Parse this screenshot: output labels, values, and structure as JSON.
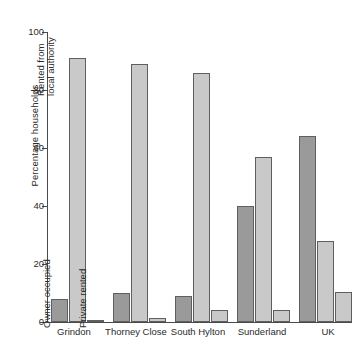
{
  "chart_data": {
    "type": "bar",
    "title": "",
    "xlabel": "",
    "ylabel": "Percentage households",
    "ylim": [
      0,
      100
    ],
    "yticks": [
      0,
      20,
      40,
      60,
      80,
      100
    ],
    "grid": false,
    "legend_position": "in-plot rotated annotations over first group",
    "categories": [
      "Grindon",
      "Thorney Close",
      "South Hylton",
      "Sunderland",
      "UK"
    ],
    "series": [
      {
        "name": "Owner occupied",
        "color": "#9a9a9a",
        "values": [
          8,
          10,
          9,
          40,
          64
        ]
      },
      {
        "name": "Rented from local authority",
        "color": "#c9c9c9",
        "values": [
          91,
          89,
          86,
          57,
          28
        ]
      },
      {
        "name": "Private rented",
        "color": "#c9c9c9",
        "values": [
          0.5,
          1.5,
          4,
          4,
          10.5
        ]
      }
    ]
  },
  "annotations": [
    {
      "text": "Owner occupied",
      "series": 0
    },
    {
      "text": "Rented from local authority",
      "series": 1
    },
    {
      "text": "Private rented",
      "series": 2
    }
  ],
  "axis": {
    "y_label": "Percentage households",
    "y_tick_0": "0",
    "y_tick_1": "20",
    "y_tick_2": "40",
    "y_tick_3": "60",
    "y_tick_4": "80",
    "y_tick_5": "100"
  },
  "categories": {
    "c0": "Grindon",
    "c1": "Thorney Close",
    "c2": "South Hylton",
    "c3": "Sunderland",
    "c4": "UK"
  },
  "series_labels": {
    "s0": "Owner occupied",
    "s1_line1": "Rented from",
    "s1_line2": "local authority",
    "s2": "Private rented"
  }
}
